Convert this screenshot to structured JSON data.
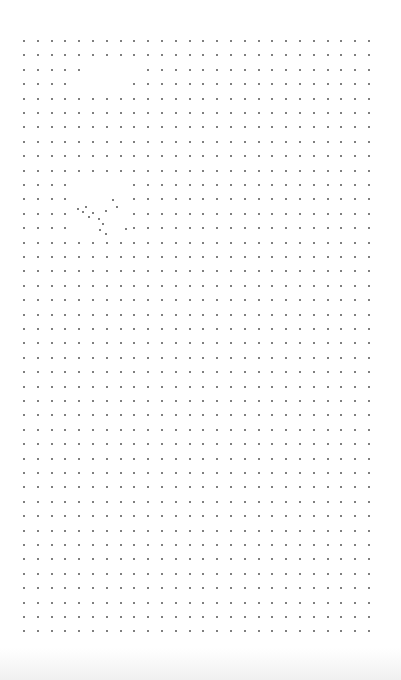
{
  "page": {
    "type": "dot-grid paper",
    "background": "#ffffff",
    "dot_color": "#555555"
  },
  "grid": {
    "origin_x": 24,
    "origin_y": 41,
    "spacing_x": 13.8,
    "spacing_y": 14.4,
    "columns": 26,
    "rows": 42,
    "missing": [
      [
        7,
        3
      ],
      [
        8,
        3
      ],
      [
        9,
        3
      ],
      [
        10,
        3
      ],
      [
        7,
        4
      ],
      [
        8,
        4
      ],
      [
        9,
        4
      ],
      [
        10,
        4
      ],
      [
        5,
        12
      ],
      [
        6,
        12
      ],
      [
        7,
        12
      ],
      [
        8,
        12
      ],
      [
        4,
        13
      ],
      [
        5,
        13
      ],
      [
        6,
        13
      ],
      [
        7,
        13
      ]
    ]
  },
  "scattered_dots": [
    [
      78,
      209
    ],
    [
      83,
      212
    ],
    [
      89,
      217
    ],
    [
      93,
      213
    ],
    [
      99,
      219
    ],
    [
      106,
      211
    ],
    [
      103,
      224
    ],
    [
      113,
      200
    ],
    [
      117,
      207
    ],
    [
      100,
      230
    ],
    [
      106,
      234
    ],
    [
      126,
      229
    ],
    [
      86,
      207
    ]
  ]
}
